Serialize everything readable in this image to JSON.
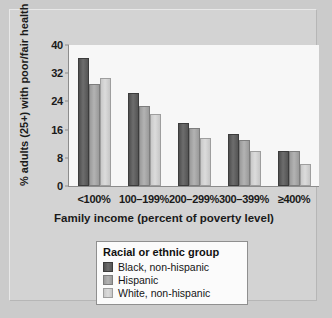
{
  "chart_data": {
    "type": "bar",
    "title": "",
    "xlabel": "Family income (percent of poverty level)",
    "ylabel": "% adults (25+) with poor/fair health",
    "categories": [
      "<100%",
      "100–199%",
      "200–299%",
      "300–399%",
      "≥400%"
    ],
    "ylim": [
      0,
      40
    ],
    "yticks": [
      0,
      8,
      16,
      24,
      32,
      40
    ],
    "ytick_labels": [
      "0",
      "8",
      "16",
      "24",
      "32",
      "40"
    ],
    "grid": false,
    "legend_position": "below-center",
    "legend_title": "Racial or ethnic group",
    "series": [
      {
        "name": "Black, non-hispanic",
        "color": "#5c5c5c",
        "values": [
          36.2,
          26.5,
          18.0,
          14.8,
          9.8
        ]
      },
      {
        "name": "Hispanic",
        "color": "#a8a8a8",
        "values": [
          29.0,
          22.8,
          16.5,
          13.0,
          9.8
        ]
      },
      {
        "name": "White, non-hispanic",
        "color": "#d2d2d2",
        "values": [
          30.6,
          20.5,
          13.6,
          9.8,
          6.2
        ]
      }
    ]
  },
  "figure": {
    "background_color": "#cbcbcb",
    "panel_color": "#d3d3d3",
    "plot_background_color": "#f7f7f7",
    "axis_color": "#8c8c8c"
  }
}
